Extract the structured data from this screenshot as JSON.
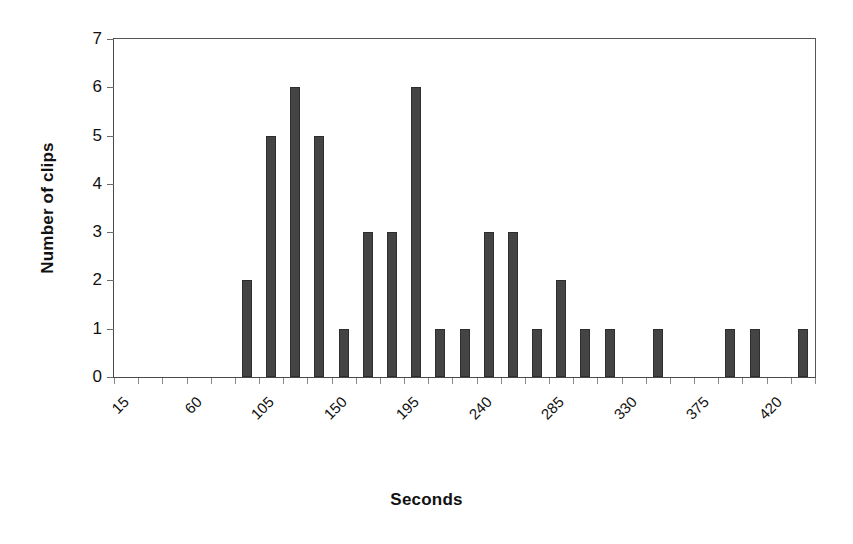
{
  "chart_data": {
    "type": "bar",
    "title": "",
    "xlabel": "Seconds",
    "ylabel": "Number of clips",
    "xlim": [
      15,
      450
    ],
    "ylim": [
      0,
      7
    ],
    "ytick_step": 1,
    "yticks": [
      "0",
      "1",
      "2",
      "3",
      "4",
      "5",
      "6",
      "7"
    ],
    "bin_width": 15,
    "tick_step": 15,
    "xtick_label_step": 45,
    "xtick_labels": [
      "15",
      "60",
      "105",
      "150",
      "195",
      "240",
      "285",
      "330",
      "375",
      "420"
    ],
    "grid": false,
    "legend": false,
    "bar_color": "#444444",
    "bar_edge_color": "#2e2e2e",
    "axis_color": "#4a4a4a",
    "categories": [
      "15",
      "30",
      "45",
      "60",
      "75",
      "90",
      "105",
      "120",
      "135",
      "150",
      "165",
      "180",
      "195",
      "210",
      "225",
      "240",
      "255",
      "270",
      "285",
      "300",
      "315",
      "330",
      "345",
      "360",
      "375",
      "390",
      "405",
      "420",
      "435"
    ],
    "values": [
      0,
      0,
      0,
      0,
      0,
      2,
      5,
      6,
      5,
      1,
      3,
      3,
      6,
      1,
      1,
      3,
      3,
      1,
      2,
      1,
      1,
      0,
      1,
      0,
      0,
      1,
      1,
      0,
      1
    ]
  }
}
